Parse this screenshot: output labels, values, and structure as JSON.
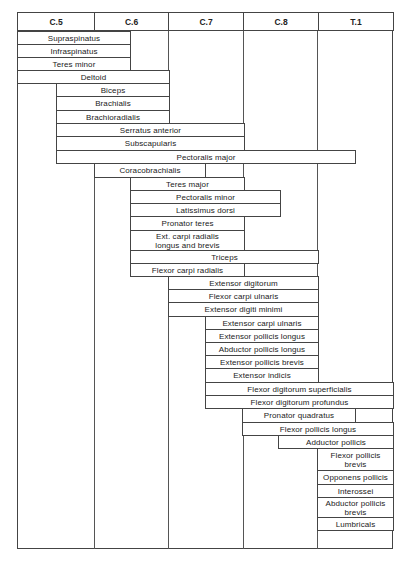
{
  "chart_data": {
    "type": "table",
    "title": "",
    "columns": [
      "C.5",
      "C.6",
      "C.7",
      "C.8",
      "T.1"
    ],
    "column_x": [
      17,
      94,
      168,
      243,
      318,
      393
    ],
    "rows": [
      {
        "label": "Supraspinatus",
        "x1": 17,
        "x2": 130,
        "y": 31,
        "h": 13,
        "segments": "C.5–C.6"
      },
      {
        "label": "Infraspinatus",
        "x1": 17,
        "x2": 130,
        "y": 44,
        "h": 13,
        "segments": "C.5–C.6"
      },
      {
        "label": "Teres minor",
        "x1": 17,
        "x2": 130,
        "y": 57,
        "h": 13,
        "segments": "C.5–C.6"
      },
      {
        "label": "Deltoid",
        "x1": 17,
        "x2": 169,
        "y": 70,
        "h": 13,
        "segments": "C.5–C.6"
      },
      {
        "label": "Biceps",
        "x1": 56,
        "x2": 169,
        "y": 83,
        "h": 13,
        "segments": "C.5–C.6"
      },
      {
        "label": "Brachialis",
        "x1": 56,
        "x2": 169,
        "y": 96,
        "h": 14,
        "segments": "C.5–C.6"
      },
      {
        "label": "Brachioradialis",
        "x1": 56,
        "x2": 169,
        "y": 110,
        "h": 13,
        "segments": "C.5–C.6"
      },
      {
        "label": "Serratus anterior",
        "x1": 56,
        "x2": 244,
        "y": 123,
        "h": 13,
        "segments": "C.5–C.7"
      },
      {
        "label": "Subscapularis",
        "x1": 56,
        "x2": 244,
        "y": 136,
        "h": 14,
        "segments": "C.5–C.7"
      },
      {
        "label": "Pectoralis major",
        "x1": 56,
        "x2": 355,
        "y": 150,
        "h": 13,
        "segments": "C.5–T.1"
      },
      {
        "label": "Coracobrachialis",
        "x1": 94,
        "x2": 205,
        "y": 163,
        "h": 14,
        "segments": "C.6–C.7"
      },
      {
        "label": "Teres major",
        "x1": 130,
        "x2": 244,
        "y": 177,
        "h": 13,
        "segments": "C.6–C.7"
      },
      {
        "label": "Pectoralis minor",
        "x1": 130,
        "x2": 280,
        "y": 190,
        "h": 13,
        "segments": "C.6–C.8"
      },
      {
        "label": "Latissimus dorsi",
        "x1": 130,
        "x2": 280,
        "y": 203,
        "h": 13,
        "segments": "C.6–C.8"
      },
      {
        "label": "Pronator teres",
        "x1": 130,
        "x2": 244,
        "y": 216,
        "h": 14,
        "segments": "C.6–C.7"
      },
      {
        "label": "Ext. carpi radialis\nlongus and brevis",
        "x1": 130,
        "x2": 244,
        "y": 230,
        "h": 20,
        "segments": "C.6–C.7"
      },
      {
        "label": "Triceps",
        "x1": 130,
        "x2": 318,
        "y": 250,
        "h": 13,
        "segments": "C.6–C.8"
      },
      {
        "label": "Flexor carpi radialis",
        "x1": 130,
        "x2": 244,
        "y": 263,
        "h": 13,
        "segments": "C.6–C.7"
      },
      {
        "label": "Extensor digitorum",
        "x1": 168,
        "x2": 318,
        "y": 276,
        "h": 13,
        "segments": "C.7–C.8"
      },
      {
        "label": "Flexor carpi ulnaris",
        "x1": 168,
        "x2": 318,
        "y": 289,
        "h": 13,
        "segments": "C.7–C.8"
      },
      {
        "label": "Extensor digiti minimi",
        "x1": 168,
        "x2": 318,
        "y": 302,
        "h": 14,
        "segments": "C.7–C.8"
      },
      {
        "label": "Extensor carpi ulnaris",
        "x1": 205,
        "x2": 318,
        "y": 316,
        "h": 13,
        "segments": "C.7–C.8"
      },
      {
        "label": "Extensor pollicis longus",
        "x1": 205,
        "x2": 318,
        "y": 329,
        "h": 13,
        "segments": "C.7–C.8"
      },
      {
        "label": "Abductor pollicis longus",
        "x1": 205,
        "x2": 318,
        "y": 342,
        "h": 13,
        "segments": "C.7–C.8"
      },
      {
        "label": "Extensor pollicis brevis",
        "x1": 205,
        "x2": 318,
        "y": 355,
        "h": 13,
        "segments": "C.7–C.8"
      },
      {
        "label": "Extensor indicis",
        "x1": 205,
        "x2": 318,
        "y": 368,
        "h": 14,
        "segments": "C.7–C.8"
      },
      {
        "label": "Flexor digitorum superficialis",
        "x1": 205,
        "x2": 393,
        "y": 382,
        "h": 13,
        "segments": "C.7–T.1"
      },
      {
        "label": "Flexor digitorum profundus",
        "x1": 205,
        "x2": 393,
        "y": 395,
        "h": 13,
        "segments": "C.7–T.1"
      },
      {
        "label": "Pronator quadratus",
        "x1": 242,
        "x2": 355,
        "y": 408,
        "h": 14,
        "segments": "C.8–T.1"
      },
      {
        "label": "Flexor pollicis longus",
        "x1": 242,
        "x2": 393,
        "y": 422,
        "h": 13,
        "segments": "C.8–T.1"
      },
      {
        "label": "Adductor pollicis",
        "x1": 278,
        "x2": 393,
        "y": 435,
        "h": 13,
        "segments": "C.8–T.1"
      },
      {
        "label": "Flexor pollicis\nbrevis",
        "x1": 317,
        "x2": 393,
        "y": 448,
        "h": 22,
        "segments": "T.1"
      },
      {
        "label": "Opponens pollicis",
        "x1": 317,
        "x2": 393,
        "y": 470,
        "h": 14,
        "segments": "T.1"
      },
      {
        "label": "Interossei",
        "x1": 317,
        "x2": 393,
        "y": 484,
        "h": 13,
        "segments": "T.1"
      },
      {
        "label": "Abductor pollicis\nbrevis",
        "x1": 317,
        "x2": 393,
        "y": 497,
        "h": 20,
        "segments": "T.1"
      },
      {
        "label": "Lumbricals",
        "x1": 317,
        "x2": 393,
        "y": 517,
        "h": 13,
        "segments": "T.1"
      }
    ],
    "vertical_lines": [
      {
        "x": 94,
        "y1": 163,
        "y2": 549
      },
      {
        "x": 130,
        "y1": 31,
        "y2": 70
      },
      {
        "x": 168,
        "y1": 31,
        "y2": 549
      },
      {
        "x": 243,
        "y1": 31,
        "y2": 549
      },
      {
        "x": 317,
        "y1": 31,
        "y2": 549
      }
    ]
  }
}
